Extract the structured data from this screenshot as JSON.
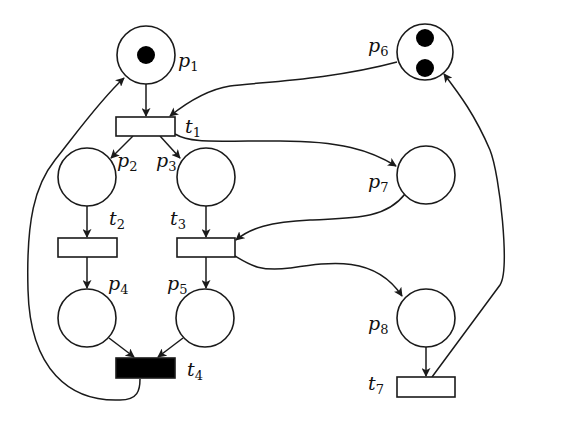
{
  "diagram": {
    "type": "petri-net",
    "colors": {
      "stroke": "#1a1a1a",
      "token": "#000000",
      "background": "#ffffff",
      "filled_transition": "#000000"
    },
    "places": [
      {
        "id": "p1",
        "label": "p",
        "sub": "1",
        "tokens": 1
      },
      {
        "id": "p2",
        "label": "p",
        "sub": "2",
        "tokens": 0
      },
      {
        "id": "p3",
        "label": "p",
        "sub": "3",
        "tokens": 0
      },
      {
        "id": "p4",
        "label": "p",
        "sub": "4",
        "tokens": 0
      },
      {
        "id": "p5",
        "label": "p",
        "sub": "5",
        "tokens": 0
      },
      {
        "id": "p6",
        "label": "p",
        "sub": "6",
        "tokens": 2
      },
      {
        "id": "p7",
        "label": "p",
        "sub": "7",
        "tokens": 0
      },
      {
        "id": "p8",
        "label": "p",
        "sub": "8",
        "tokens": 0
      }
    ],
    "transitions": [
      {
        "id": "t1",
        "label": "t",
        "sub": "1",
        "filled": false
      },
      {
        "id": "t2",
        "label": "t",
        "sub": "2",
        "filled": false
      },
      {
        "id": "t3",
        "label": "t",
        "sub": "3",
        "filled": false
      },
      {
        "id": "t4",
        "label": "t",
        "sub": "4",
        "filled": true
      },
      {
        "id": "t7",
        "label": "t",
        "sub": "7",
        "filled": false
      }
    ],
    "arcs": [
      {
        "from": "p1",
        "to": "t1"
      },
      {
        "from": "p6",
        "to": "t1"
      },
      {
        "from": "t1",
        "to": "p2"
      },
      {
        "from": "t1",
        "to": "p3"
      },
      {
        "from": "t1",
        "to": "p7"
      },
      {
        "from": "p2",
        "to": "t2"
      },
      {
        "from": "p3",
        "to": "t3"
      },
      {
        "from": "p7",
        "to": "t3"
      },
      {
        "from": "t2",
        "to": "p4"
      },
      {
        "from": "t3",
        "to": "p5"
      },
      {
        "from": "t3",
        "to": "p8"
      },
      {
        "from": "p4",
        "to": "t4"
      },
      {
        "from": "p5",
        "to": "t4"
      },
      {
        "from": "t4",
        "to": "p1"
      },
      {
        "from": "p8",
        "to": "t7"
      },
      {
        "from": "t7",
        "to": "p6"
      }
    ]
  }
}
